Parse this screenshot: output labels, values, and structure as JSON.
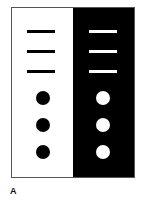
{
  "figure": {
    "panel_label": "A",
    "left_panel": {
      "background": "#ffffff",
      "foreground": "#000000",
      "bars": 3,
      "dots": 3
    },
    "right_panel": {
      "background": "#000000",
      "foreground": "#ffffff",
      "bars": 3,
      "dots": 3
    }
  }
}
